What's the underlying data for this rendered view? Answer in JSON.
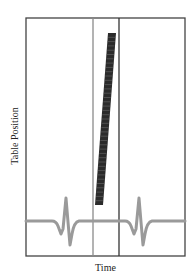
{
  "diagram": {
    "title": "",
    "xlabel": "Time",
    "ylabel": "Table Position",
    "frame": {
      "left": 26,
      "top": 18,
      "right": 185,
      "bottom": 256,
      "stroke": "#444444"
    },
    "acquisition_window": {
      "left_line_x": 93,
      "right_line_x": 119,
      "left_line_color": "#8a8a8a",
      "right_line_color": "#333333"
    },
    "table_motion_bar": {
      "top": {
        "x_left": 108,
        "x_right": 116,
        "y": 33
      },
      "bottom": {
        "x_left": 95,
        "x_right": 103,
        "y": 205
      },
      "color": "#2b2b2b",
      "segments": 40
    },
    "ecg_trace": {
      "baseline_y": 221,
      "color": "#9a9a9a",
      "complexes": [
        {
          "center_x": 66
        },
        {
          "center_x": 139
        }
      ]
    }
  },
  "chart_data": {
    "type": "diagram",
    "title": "",
    "xlabel": "Time",
    "ylabel": "Table Position",
    "elements": [
      {
        "kind": "ECG waveform",
        "r_peaks_at_x_fraction": [
          0.25,
          0.71
        ]
      },
      {
        "kind": "acquisition window",
        "x_fraction_range": [
          0.42,
          0.58
        ]
      },
      {
        "kind": "table position ramp",
        "description": "linear increase of table position during acquisition window"
      }
    ]
  }
}
